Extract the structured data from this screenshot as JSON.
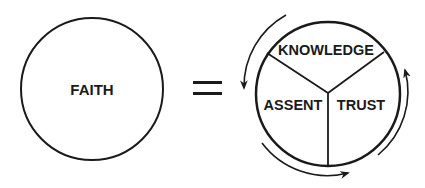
{
  "diagram": {
    "left_circle": {
      "label": "FAITH"
    },
    "operator": {
      "symbol": "="
    },
    "right_circle": {
      "segments": [
        {
          "id": "knowledge",
          "label": "KNOWLEDGE"
        },
        {
          "id": "assent",
          "label": "ASSENT"
        },
        {
          "id": "trust",
          "label": "TRUST"
        }
      ],
      "cycle_arrows": [
        {
          "position": "left",
          "direction": "counterclockwise-down"
        },
        {
          "position": "bottom",
          "direction": "counterclockwise-right"
        },
        {
          "position": "right",
          "direction": "counterclockwise-up"
        }
      ]
    },
    "colors": {
      "stroke": "#1a1a1a",
      "background": "#ffffff"
    }
  }
}
